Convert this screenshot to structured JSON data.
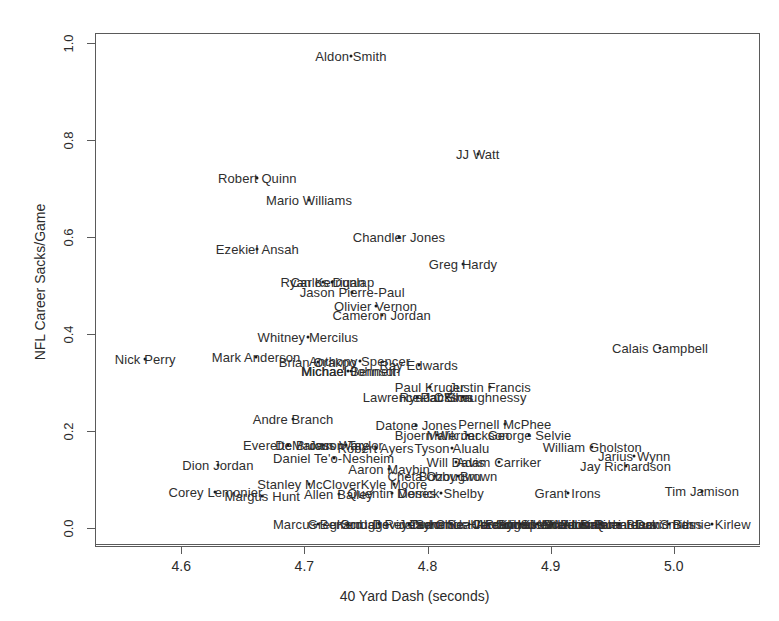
{
  "chart_data": {
    "type": "scatter",
    "title": "",
    "xlabel": "40 Yard Dash (seconds)",
    "ylabel": "NFL Career Sacks/Game",
    "xlim": [
      4.53,
      5.07
    ],
    "ylim": [
      -0.035,
      1.02
    ],
    "xticks": [
      "4.6",
      "4.7",
      "4.8",
      "4.9",
      "5.0"
    ],
    "xtick_values": [
      4.6,
      4.7,
      4.8,
      4.9,
      5.0
    ],
    "yticks": [
      "0.0",
      "0.2",
      "0.4",
      "0.6",
      "0.8",
      "1.0"
    ],
    "ytick_values": [
      0.0,
      0.2,
      0.4,
      0.6,
      0.8,
      1.0
    ],
    "grid": false,
    "legend": false,
    "point_render": "text-labels",
    "points": [
      {
        "label": "Aldon Smith",
        "x": 4.737,
        "y": 0.975
      },
      {
        "label": "JJ Watt",
        "x": 4.84,
        "y": 0.772
      },
      {
        "label": "Robert Quinn",
        "x": 4.661,
        "y": 0.723
      },
      {
        "label": "Mario Williams",
        "x": 4.703,
        "y": 0.677
      },
      {
        "label": "Chandler Jones",
        "x": 4.776,
        "y": 0.602
      },
      {
        "label": "Ezekiel Ansah",
        "x": 4.661,
        "y": 0.576
      },
      {
        "label": "Greg Hardy",
        "x": 4.828,
        "y": 0.546
      },
      {
        "label": "Ryan Kerrigan",
        "x": 4.714,
        "y": 0.508
      },
      {
        "label": "Carlos Dunlap",
        "x": 4.722,
        "y": 0.508
      },
      {
        "label": "Jason Pierre-Paul",
        "x": 4.738,
        "y": 0.489
      },
      {
        "label": "Olivier Vernon",
        "x": 4.757,
        "y": 0.46
      },
      {
        "label": "Cameron Jordan",
        "x": 4.762,
        "y": 0.44
      },
      {
        "label": "Whitney Mercilus",
        "x": 4.702,
        "y": 0.396
      },
      {
        "label": "Calais Campbell",
        "x": 4.988,
        "y": 0.374
      },
      {
        "label": "Mark Anderson",
        "x": 4.66,
        "y": 0.355
      },
      {
        "label": "Nick Perry",
        "x": 4.57,
        "y": 0.35
      },
      {
        "label": "Brian Orakpo",
        "x": 4.71,
        "y": 0.345
      },
      {
        "label": "Anthony Spencer",
        "x": 4.744,
        "y": 0.347
      },
      {
        "label": "Michael Johnson",
        "x": 4.737,
        "y": 0.326
      },
      {
        "label": "Michael Bennett",
        "x": 4.735,
        "y": 0.326
      },
      {
        "label": "Ray Edwards",
        "x": 4.792,
        "y": 0.337
      },
      {
        "label": "Paul Kruger",
        "x": 4.801,
        "y": 0.292
      },
      {
        "label": "Justin Francis",
        "x": 4.85,
        "y": 0.292
      },
      {
        "label": "Lawrence Jackson",
        "x": 4.791,
        "y": 0.272
      },
      {
        "label": "Pat Sims",
        "x": 4.815,
        "y": 0.272
      },
      {
        "label": "Ryan O'Shaughnessy",
        "x": 4.828,
        "y": 0.272
      },
      {
        "label": "Andre Branch",
        "x": 4.69,
        "y": 0.226
      },
      {
        "label": "Datone Jones",
        "x": 4.79,
        "y": 0.214
      },
      {
        "label": "Pernell McPhee",
        "x": 4.862,
        "y": 0.216
      },
      {
        "label": "Bjoern Werner",
        "x": 4.807,
        "y": 0.193
      },
      {
        "label": "Malik Jackson",
        "x": 4.832,
        "y": 0.193
      },
      {
        "label": "George Selvie",
        "x": 4.882,
        "y": 0.193
      },
      {
        "label": "Everette Brown",
        "x": 4.686,
        "y": 0.174
      },
      {
        "label": "DeMarcus Ware",
        "x": 4.714,
        "y": 0.174
      },
      {
        "label": "Jason Taylor",
        "x": 4.733,
        "y": 0.174
      },
      {
        "label": "Robert Ayers",
        "x": 4.757,
        "y": 0.166
      },
      {
        "label": "Tyson Alualu",
        "x": 4.819,
        "y": 0.166
      },
      {
        "label": "William Gholston",
        "x": 4.933,
        "y": 0.168
      },
      {
        "label": "Daniel Te'o-Nesheim",
        "x": 4.723,
        "y": 0.146
      },
      {
        "label": "Will Davis",
        "x": 4.822,
        "y": 0.139
      },
      {
        "label": "Adam Carriker",
        "x": 4.857,
        "y": 0.139
      },
      {
        "label": "Jarius Wynn",
        "x": 4.967,
        "y": 0.15
      },
      {
        "label": "Jay Richardson",
        "x": 4.96,
        "y": 0.13
      },
      {
        "label": "Dion Jordan",
        "x": 4.629,
        "y": 0.131
      },
      {
        "label": "Aaron Maybin",
        "x": 4.768,
        "y": 0.124
      },
      {
        "label": "Cheta Ozougwu",
        "x": 4.805,
        "y": 0.11
      },
      {
        "label": "Bobby Brown",
        "x": 4.824,
        "y": 0.11
      },
      {
        "label": "Kyle Moore",
        "x": 4.772,
        "y": 0.093
      },
      {
        "label": "Stanley McClover",
        "x": 4.703,
        "y": 0.093
      },
      {
        "label": "Quentin Moses",
        "x": 4.77,
        "y": 0.074
      },
      {
        "label": "Derrick Shelby",
        "x": 4.81,
        "y": 0.074
      },
      {
        "label": "Grant Irons",
        "x": 4.913,
        "y": 0.074
      },
      {
        "label": "Tim Jamison",
        "x": 5.022,
        "y": 0.078
      },
      {
        "label": "Corey Lemonier",
        "x": 4.627,
        "y": 0.077
      },
      {
        "label": "Margus Hunt",
        "x": 4.665,
        "y": 0.068
      },
      {
        "label": "Allen Bailey",
        "x": 4.727,
        "y": 0.072
      },
      {
        "label": "Bernie Kirlew",
        "x": 5.03,
        "y": 0.01
      },
      {
        "label": "Marcus Benard",
        "x": 4.71,
        "y": 0.01
      },
      {
        "label": "Greg Scruggs",
        "x": 4.735,
        "y": 0.01
      },
      {
        "label": "Kendall Reyes",
        "x": 4.76,
        "y": 0.01
      },
      {
        "label": "Devin Taylor",
        "x": 4.784,
        "y": 0.01
      },
      {
        "label": "Jared Crick",
        "x": 4.803,
        "y": 0.01
      },
      {
        "label": "Sammie Hill",
        "x": 4.818,
        "y": 0.01
      },
      {
        "label": "Cornellius Carradine",
        "x": 4.833,
        "y": 0.01
      },
      {
        "label": "Sealver Siliga",
        "x": 4.848,
        "y": 0.01
      },
      {
        "label": "Jordan Hill",
        "x": 4.862,
        "y": 0.01
      },
      {
        "label": "Akeem Spence",
        "x": 4.875,
        "y": 0.01
      },
      {
        "label": "Brandon Williams",
        "x": 4.888,
        "y": 0.01
      },
      {
        "label": "Sylvester Williams",
        "x": 4.9,
        "y": 0.01
      },
      {
        "label": "John Jenkins",
        "x": 4.912,
        "y": 0.01
      },
      {
        "label": "Star Lotulelei",
        "x": 4.925,
        "y": 0.01
      },
      {
        "label": "Sheldon Richardson",
        "x": 4.94,
        "y": 0.01
      },
      {
        "label": "Datone Black",
        "x": 4.955,
        "y": 0.01
      },
      {
        "label": "Quanterus Smith",
        "x": 4.975,
        "y": 0.01
      },
      {
        "label": "David Bass",
        "x": 4.995,
        "y": 0.01
      }
    ],
    "dense_overlap_row": {
      "y": 0.01,
      "note": "bottom row of overplotted labels spanning x 4.63 to 5.05"
    }
  },
  "axis": {
    "xlabel": "40 Yard Dash (seconds)",
    "ylabel": "NFL Career Sacks/Game"
  }
}
